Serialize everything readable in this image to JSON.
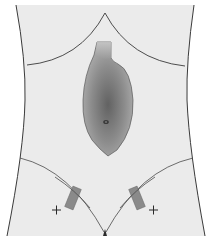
{
  "diagram": {
    "colors": {
      "background": "#ffffff",
      "skin": "#ebebeb",
      "outline": "#3a3a3a",
      "organ_dark": "#6e6e6e",
      "organ_mid": "#939393",
      "organ_light": "#b8b8b8",
      "port": "#8a8a8a",
      "navel": "#2a2a2a"
    },
    "elements": {
      "torso": "torso-outline",
      "rib_margin": "costal-margin-arc",
      "organ": "stomach-pouch",
      "navel": "umbilicus",
      "inguinal_left": "inguinal-line-left",
      "inguinal_right": "inguinal-line-right",
      "port_left": "port-site-left",
      "port_right": "port-site-right",
      "marker_left": "cross-marker-left",
      "marker_right": "cross-marker-right"
    }
  }
}
